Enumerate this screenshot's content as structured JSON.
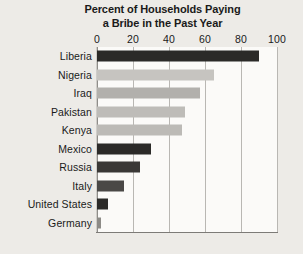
{
  "chart_data": {
    "type": "bar",
    "orientation": "horizontal",
    "title": "Percent of Households Paying a Bribe in the Past Year",
    "title_lines": [
      "Percent of Households Paying",
      "a Bribe in the Past Year"
    ],
    "xlabel": "",
    "ylabel": "",
    "xlim": [
      0,
      100
    ],
    "xticks": [
      0,
      20,
      40,
      60,
      80,
      100
    ],
    "xtick_labels": [
      "0",
      "20",
      "40",
      "60",
      "80",
      "100"
    ],
    "grid": true,
    "grid_axis": "x",
    "legend": false,
    "categories": [
      "Liberia",
      "Nigeria",
      "Iraq",
      "Pakistan",
      "Kenya",
      "Mexico",
      "Russia",
      "Italy",
      "United States",
      "Germany"
    ],
    "values": [
      90,
      65,
      57,
      49,
      47,
      30,
      24,
      15,
      6,
      2
    ],
    "bar_colors": [
      "#2b2a28",
      "#c6c4c0",
      "#b2b0ac",
      "#bebcb8",
      "#bcbab6",
      "#2b2a28",
      "#3a3836",
      "#4a4846",
      "#2b2a28",
      "#8d8b87"
    ],
    "bars": [
      {
        "label": "Liberia",
        "value": 90,
        "color": "#2b2a28"
      },
      {
        "label": "Nigeria",
        "value": 65,
        "color": "#c6c4c0"
      },
      {
        "label": "Iraq",
        "value": 57,
        "color": "#b2b0ac"
      },
      {
        "label": "Pakistan",
        "value": 49,
        "color": "#bebcb8"
      },
      {
        "label": "Kenya",
        "value": 47,
        "color": "#bcbab6"
      },
      {
        "label": "Mexico",
        "value": 30,
        "color": "#2b2a28"
      },
      {
        "label": "Russia",
        "value": 24,
        "color": "#3a3836"
      },
      {
        "label": "Italy",
        "value": 15,
        "color": "#4a4846"
      },
      {
        "label": "United States",
        "value": 6,
        "color": "#2b2a28"
      },
      {
        "label": "Germany",
        "value": 2,
        "color": "#8d8b87"
      }
    ]
  },
  "style": {
    "page_background": "#edebe7",
    "plot_background": "#fbfaf8",
    "gridline_color": "#b9b7b3",
    "axis_color": "#7d7b77",
    "text_color": "#1a1a1a"
  }
}
